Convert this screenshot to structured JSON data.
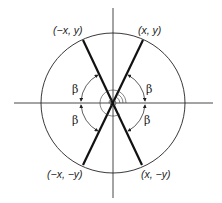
{
  "diagram": {
    "type": "unit-circle-symmetry",
    "colors": {
      "background": "#ffffff",
      "stroke": "#222222",
      "axis": "#333333"
    },
    "points": {
      "upper_right": "(x, y)",
      "upper_left": "(−x, y)",
      "lower_left": "(−x, −y)",
      "lower_right": "(x, −y)"
    },
    "angle_labels": {
      "upper_right": "β",
      "upper_left": "β",
      "lower_left": "β",
      "lower_right": "β"
    }
  }
}
